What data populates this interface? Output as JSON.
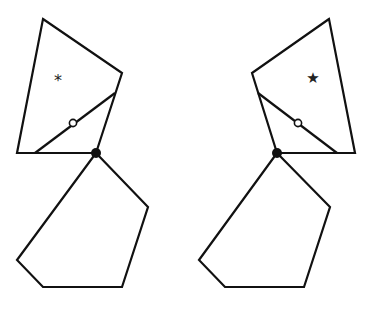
{
  "diagram": {
    "stroke_color": "#111111",
    "background": "#ffffff",
    "figures": [
      {
        "id": "left",
        "quad": "43,19 122,73 96,153 17,153",
        "inner_line": {
          "x1": 35,
          "y1": 153,
          "x2": 115,
          "y2": 93
        },
        "pentagon": "96,153 148,207 122,287 43,287 17,260",
        "hinge": {
          "x": 96,
          "y": 153
        },
        "open_circle": {
          "x": 73,
          "y": 123
        },
        "label": {
          "symbol": "*",
          "x": 58,
          "y": 86
        }
      },
      {
        "id": "right",
        "quad": "329,19 252,73 277,153 355,153",
        "inner_line": {
          "x1": 258,
          "y1": 93,
          "x2": 337,
          "y2": 153
        },
        "pentagon": "277,153 330,207 304,287 225,287 199,260",
        "hinge": {
          "x": 277,
          "y": 153
        },
        "open_circle": {
          "x": 298,
          "y": 123
        },
        "label": {
          "symbol": "★",
          "x": 313,
          "y": 83
        }
      }
    ]
  }
}
